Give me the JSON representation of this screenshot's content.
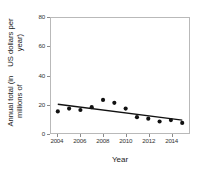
{
  "chart_data": {
    "type": "scatter",
    "title": "",
    "xlabel": "Year",
    "ylabel_line1": "Annual total (in millions of",
    "ylabel_line2": "US dollars per year)",
    "x": [
      2004,
      2005,
      2006,
      2007,
      2008,
      2009,
      2010,
      2011,
      2012,
      2013,
      2014,
      2015
    ],
    "values": [
      15,
      17,
      16,
      18,
      23,
      21,
      17,
      11,
      10,
      8,
      9,
      7
    ],
    "series": [
      {
        "name": "Annual total",
        "values": [
          15,
          17,
          16,
          18,
          23,
          21,
          17,
          11,
          10,
          8,
          9,
          7
        ]
      },
      {
        "name": "Trend line",
        "type": "line",
        "x": [
          2004,
          2015
        ],
        "values": [
          20,
          9
        ]
      }
    ],
    "xlim": [
      2003.4,
      2015.6
    ],
    "ylim": [
      0,
      80
    ],
    "xticks": [
      2004,
      2006,
      2008,
      2010,
      2012,
      2014
    ],
    "xticklabels": [
      "2004",
      "2006",
      "2008",
      "2010",
      "2012",
      "2014"
    ],
    "yticks": [
      0,
      20,
      40,
      60,
      80
    ],
    "yticklabels": [
      "0",
      "20",
      "40",
      "60",
      "80"
    ],
    "grid": false,
    "legend": false,
    "point_color": "#111111",
    "line_color": "#111111",
    "axis_color": "#b9b9b9",
    "background": "#ffffff"
  }
}
